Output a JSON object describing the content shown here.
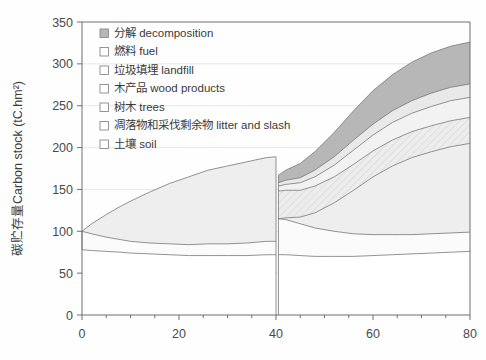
{
  "chart_data": {
    "type": "area",
    "title": "",
    "xlabel": "",
    "ylabel": "碳贮存量Carbon stock (tC.hm²)",
    "xlim": [
      0,
      80
    ],
    "ylim": [
      0,
      350
    ],
    "x_ticks": [
      "0",
      "20",
      "40",
      "60",
      "80"
    ],
    "x_tick_values": [
      0,
      20,
      40,
      60,
      80
    ],
    "x_minor_step": 5,
    "y_ticks": [
      "0",
      "50",
      "100",
      "150",
      "200",
      "250",
      "300",
      "350"
    ],
    "y_tick_values": [
      0,
      50,
      100,
      150,
      200,
      250,
      300,
      350
    ],
    "grid": "horizontal-light",
    "legend_position": "upper-left-inside",
    "stack_order_bottom_to_top": [
      "soil",
      "litter_slash",
      "trees",
      "wood_products",
      "landfill",
      "fuel",
      "decomposition"
    ],
    "x": [
      0,
      2,
      5,
      8,
      10,
      14,
      18,
      22,
      26,
      30,
      34,
      38,
      40,
      40.5,
      42,
      45,
      48,
      52,
      56,
      60,
      64,
      68,
      72,
      76,
      80
    ],
    "series": [
      {
        "name": "土壤 soil",
        "key": "soil",
        "label": "土壤 soil",
        "fill": "#ffffff",
        "swatch": "open",
        "values": [
          78,
          77,
          76,
          75,
          74,
          73,
          72,
          71,
          71,
          71,
          71,
          72,
          72,
          72,
          72,
          71,
          70,
          70,
          70,
          71,
          72,
          73,
          74,
          75,
          76
        ]
      },
      {
        "name": "凋落物和采伐剩余物 litter and slash",
        "key": "litter_slash",
        "label": "凋落物和采伐剩余物 litter and slash",
        "fill": "#fbfbfb",
        "swatch": "open",
        "values": [
          22,
          20,
          17,
          15,
          14,
          13,
          13,
          13,
          14,
          14,
          15,
          16,
          16,
          43,
          42,
          38,
          34,
          30,
          27,
          25,
          24,
          23,
          23,
          23,
          23
        ]
      },
      {
        "name": "树木 trees",
        "key": "trees",
        "label": "树木 trees",
        "fill": "#eeeeee",
        "swatch": "open",
        "values": [
          0,
          12,
          27,
          40,
          48,
          61,
          72,
          81,
          88,
          93,
          97,
          100,
          101,
          0,
          2,
          8,
          18,
          34,
          52,
          69,
          82,
          92,
          98,
          103,
          106
        ]
      },
      {
        "name": "木产品 wood products",
        "key": "wood_products",
        "label": "木产品 wood products",
        "fill": "#e4e4e4",
        "swatch": "hatch",
        "values": [
          0,
          0,
          0,
          0,
          0,
          0,
          0,
          0,
          0,
          0,
          0,
          0,
          0,
          33,
          33,
          32,
          32,
          31,
          31,
          31,
          31,
          31,
          31,
          31,
          31
        ]
      },
      {
        "name": "垃圾填埋 landfill",
        "key": "landfill",
        "label": "垃圾填埋 landfill",
        "fill": "#f2f2f2",
        "swatch": "open",
        "values": [
          0,
          0,
          0,
          0,
          0,
          0,
          0,
          0,
          0,
          0,
          0,
          0,
          0,
          6,
          7,
          9,
          11,
          14,
          17,
          19,
          21,
          22,
          23,
          24,
          24
        ]
      },
      {
        "name": "燃料 fuel",
        "key": "fuel",
        "label": "燃料 fuel",
        "fill": "#e9e9e9",
        "swatch": "open",
        "values": [
          0,
          0,
          0,
          0,
          0,
          0,
          0,
          0,
          0,
          0,
          0,
          0,
          0,
          4,
          5,
          6,
          8,
          10,
          12,
          13,
          14,
          15,
          16,
          16,
          16
        ]
      },
      {
        "name": "分解 decomposition",
        "key": "decomposition",
        "label": "分解 decomposition",
        "fill": "#b7b7b7",
        "swatch": "filled",
        "values": [
          0,
          0,
          0,
          0,
          0,
          0,
          0,
          0,
          0,
          0,
          0,
          0,
          0,
          9,
          12,
          17,
          22,
          29,
          35,
          40,
          43,
          46,
          48,
          49,
          50
        ]
      }
    ],
    "annotations": {
      "harvest_x": 40,
      "harvest_note": "stand harvested at year 40; trees pool drops to zero and wood product pools begin"
    }
  },
  "legend": {
    "items": [
      {
        "label": "分解 decomposition",
        "swatch": "filled"
      },
      {
        "label": "燃料 fuel",
        "swatch": "open"
      },
      {
        "label": "垃圾填埋 landfill",
        "swatch": "open"
      },
      {
        "label": "木产品 wood products",
        "swatch": "open"
      },
      {
        "label": "树木 trees",
        "swatch": "open"
      },
      {
        "label": "凋落物和采伐剩余物 litter and slash",
        "swatch": "open"
      },
      {
        "label": "土壤 soil",
        "swatch": "open"
      }
    ]
  },
  "colors": {
    "axis": "#6e6e6e",
    "grid": "#dcdcdc",
    "text": "#3d3d3d",
    "line": "#777777",
    "decomposition": "#b7b7b7",
    "fuel": "#e9e9e9",
    "landfill": "#f2f2f2",
    "wood_products": "#e4e4e4",
    "trees": "#eeeeee",
    "litter_slash": "#fbfbfb",
    "soil": "#ffffff"
  }
}
